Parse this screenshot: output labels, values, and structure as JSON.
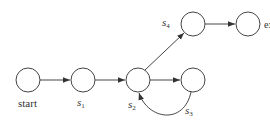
{
  "diagram": {
    "type": "state-graph",
    "colors": {
      "stroke": "#444444",
      "text": "#333333",
      "background": "#ffffff"
    },
    "nodes": [
      {
        "id": "start",
        "label": "start",
        "cx": 28,
        "cy": 80
      },
      {
        "id": "s1",
        "label": "s",
        "sub": "1",
        "cx": 83,
        "cy": 80
      },
      {
        "id": "s2",
        "label": "s",
        "sub": "2",
        "cx": 138,
        "cy": 80
      },
      {
        "id": "s3",
        "label": "s",
        "sub": "3",
        "cx": 193,
        "cy": 80
      },
      {
        "id": "s4",
        "label": "s",
        "sub": "4",
        "cx": 193,
        "cy": 24
      },
      {
        "id": "exit",
        "label": "exit",
        "cx": 248,
        "cy": 24
      }
    ],
    "edges": [
      {
        "from": "start",
        "to": "s1"
      },
      {
        "from": "s1",
        "to": "s2"
      },
      {
        "from": "s2",
        "to": "s3"
      },
      {
        "from": "s3",
        "to": "s2",
        "curved": true
      },
      {
        "from": "s2",
        "to": "s4"
      },
      {
        "from": "s4",
        "to": "exit"
      }
    ],
    "labels": {
      "start": "start",
      "s1_base": "s",
      "s1_sub": "1",
      "s2_base": "s",
      "s2_sub": "2",
      "s3_base": "s",
      "s3_sub": "3",
      "s4_base": "s",
      "s4_sub": "4",
      "exit": "exit"
    }
  }
}
